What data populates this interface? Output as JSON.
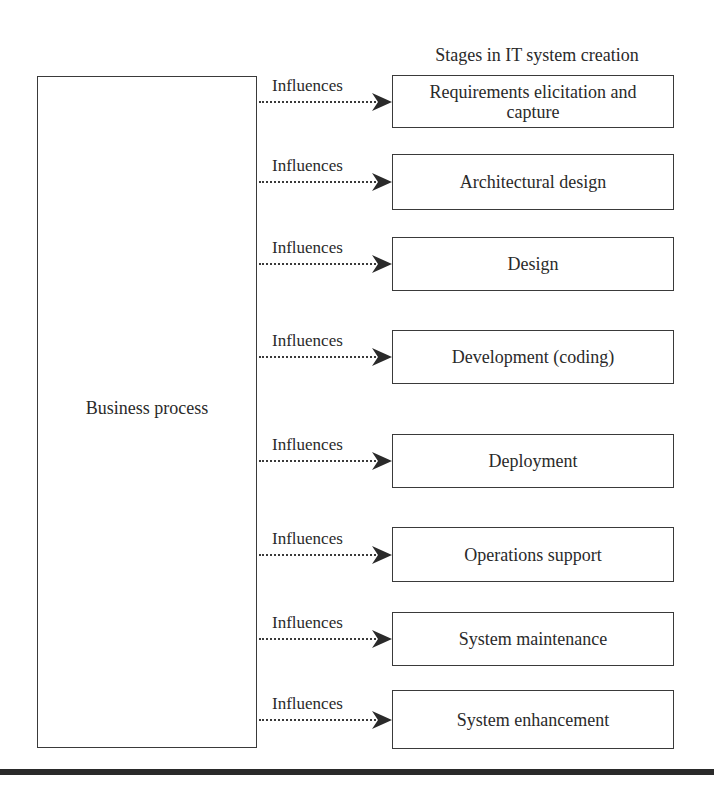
{
  "diagram": {
    "title": "Stages in IT system creation",
    "source_node": {
      "label": "Business process"
    },
    "edge_label": "Influences",
    "stages": [
      {
        "label": "Requirements elicitation and capture",
        "top": 75,
        "height": 53,
        "edge_label": "Influences"
      },
      {
        "label": "Architectural design",
        "top": 154,
        "height": 56,
        "edge_label": "Influences"
      },
      {
        "label": "Design",
        "top": 237,
        "height": 54,
        "edge_label": "Influences"
      },
      {
        "label": "Development (coding)",
        "top": 330,
        "height": 54,
        "edge_label": "Influences"
      },
      {
        "label": "Deployment",
        "top": 434,
        "height": 54,
        "edge_label": "Influences"
      },
      {
        "label": "Operations support",
        "top": 527,
        "height": 55,
        "edge_label": "Influences"
      },
      {
        "label": "System maintenance",
        "top": 612,
        "height": 54,
        "edge_label": "Influences"
      },
      {
        "label": "System enhancement",
        "top": 690,
        "height": 59,
        "edge_label": "Influences"
      }
    ],
    "colors": {
      "stroke": "#3a3a3a",
      "text": "#2a2a2a",
      "background": "#ffffff"
    }
  }
}
